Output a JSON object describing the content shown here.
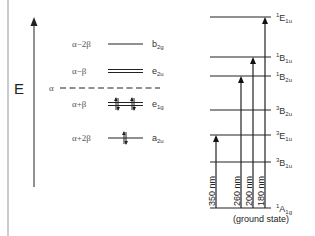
{
  "axis": {
    "label": "E",
    "alpha_label": "α"
  },
  "orbitals": [
    {
      "energy": "α−2β",
      "symmetry": "b",
      "sub": "2g",
      "degenerate": false,
      "electrons": 0
    },
    {
      "energy": "α−β",
      "symmetry": "e",
      "sub": "2u",
      "degenerate": true,
      "electrons": 0
    },
    {
      "energy": "α+β",
      "symmetry": "e",
      "sub": "1g",
      "degenerate": true,
      "electrons": 4
    },
    {
      "energy": "α+2β",
      "symmetry": "a",
      "sub": "2u",
      "degenerate": false,
      "electrons": 2
    }
  ],
  "states": [
    {
      "mult": "1",
      "sym": "E",
      "sub": "1u"
    },
    {
      "mult": "1",
      "sym": "B",
      "sub": "1u"
    },
    {
      "mult": "1",
      "sym": "B",
      "sub": "2u"
    },
    {
      "mult": "3",
      "sym": "B",
      "sub": "2u"
    },
    {
      "mult": "3",
      "sym": "E",
      "sub": "1u"
    },
    {
      "mult": "3",
      "sym": "B",
      "sub": "1u"
    },
    {
      "mult": "1",
      "sym": "A",
      "sub": "1g"
    }
  ],
  "ground_state_note": "(ground state)",
  "transitions": [
    {
      "label": "350 nm",
      "to_state": 4
    },
    {
      "label": "260 nm",
      "to_state": 2
    },
    {
      "label": "200 nm",
      "to_state": 1
    },
    {
      "label": "180 nm",
      "to_state": 0
    }
  ]
}
